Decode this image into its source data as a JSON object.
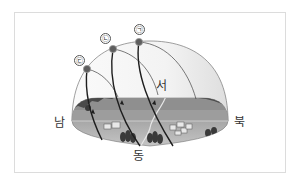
{
  "diagram": {
    "title": "",
    "directions": {
      "south": "남",
      "north": "북",
      "east": "동",
      "west": "서"
    },
    "sun_paths": [
      {
        "label": "㉠",
        "name": "path-a"
      },
      {
        "label": "㉡",
        "name": "path-b"
      },
      {
        "label": "㉢",
        "name": "path-c"
      }
    ],
    "colors": {
      "dome_fill": "#f2f2f2",
      "ground_far": "#8c8c8c",
      "ground_near": "#b5b5b5",
      "mountain": "#4a4a4a",
      "sun": "#666666",
      "path_line": "#222222",
      "frame_border": "#dcdcdc"
    }
  }
}
